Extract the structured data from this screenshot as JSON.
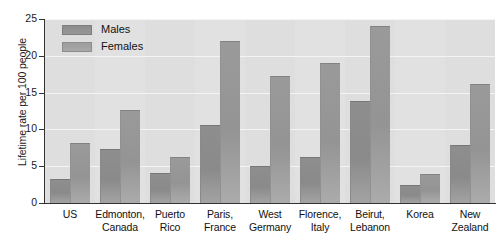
{
  "chart_data": {
    "type": "bar",
    "title": "",
    "xlabel": "",
    "ylabel": "Lifetime rate per 100 people",
    "ylim": [
      0,
      25
    ],
    "yticks": [
      0,
      5,
      10,
      15,
      20,
      25
    ],
    "grid": true,
    "legend_position": "top-left",
    "categories": [
      "US",
      "Edmonton, Canada",
      "Puerto Rico",
      "Paris, France",
      "West Germany",
      "Florence, Italy",
      "Beirut, Lebanon",
      "Korea",
      "New Zealand"
    ],
    "category_lines": [
      [
        "US",
        ""
      ],
      [
        "Edmonton,",
        "Canada"
      ],
      [
        "Puerto",
        "Rico"
      ],
      [
        "Paris,",
        "France"
      ],
      [
        "West",
        "Germany"
      ],
      [
        "Florence,",
        "Italy"
      ],
      [
        "Beirut,",
        "Lebanon"
      ],
      [
        "Korea",
        ""
      ],
      [
        "New",
        "Zealand"
      ]
    ],
    "series": [
      {
        "name": "Males",
        "color": "#8e8e8e",
        "values": [
          3.2,
          7.3,
          4.1,
          10.6,
          5.0,
          6.2,
          13.8,
          2.4,
          7.9
        ]
      },
      {
        "name": "Females",
        "color": "#9a9a9a",
        "values": [
          8.2,
          12.6,
          6.2,
          22.0,
          17.2,
          19.0,
          24.0,
          3.9,
          16.2
        ]
      }
    ]
  },
  "legend": {
    "items": [
      {
        "label": "Males"
      },
      {
        "label": "Females"
      }
    ]
  },
  "axis": {
    "y_title": "Lifetime rate per 100 people",
    "y_tick_labels": [
      "0",
      "5",
      "10",
      "15",
      "20",
      "25"
    ]
  },
  "colors": {
    "plot_background": "#dedede",
    "gridline": "#f4f4f4",
    "axis": "#333333",
    "males_bar": "#8e8e8e",
    "females_bar": "#9a9a9a",
    "text": "#111111"
  }
}
